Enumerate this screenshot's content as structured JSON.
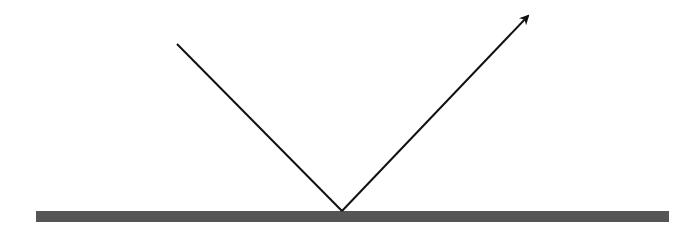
{
  "diagram": {
    "width": 693,
    "height": 237,
    "background": "#ffffff",
    "surface": {
      "x": 36,
      "y": 211,
      "width": 633,
      "height": 11,
      "color": "#555555"
    },
    "incident_ray": {
      "x1": 177,
      "y1": 44,
      "x2": 342,
      "y2": 211,
      "color": "#111111",
      "stroke_width": 2
    },
    "reflected_ray": {
      "x1": 342,
      "y1": 211,
      "x2": 528,
      "y2": 16,
      "color": "#111111",
      "stroke_width": 2,
      "arrowhead": true
    },
    "point_of_incidence": {
      "x": 342,
      "y": 211
    }
  }
}
